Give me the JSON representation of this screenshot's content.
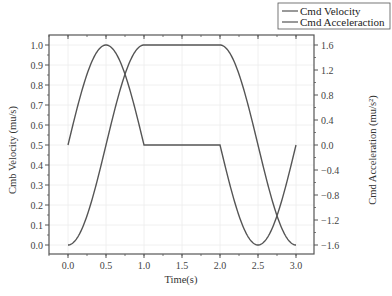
{
  "chart_data": {
    "type": "line",
    "title": "",
    "xlabel": "Time(s)",
    "ylabel": "Cmb Velocity (mu/s)",
    "y2label": "Cmd Acceleration (mu/s²)",
    "xlim": [
      -0.25,
      3.1
    ],
    "ylim": [
      -0.05,
      1.05
    ],
    "y2lim": [
      -1.76,
      1.76
    ],
    "x_ticks": [
      "0.0",
      "0.5",
      "1.0",
      "1.5",
      "2.0",
      "2.5",
      "3.0"
    ],
    "y_ticks": [
      "0.0",
      "0.1",
      "0.2",
      "0.3",
      "0.4",
      "0.5",
      "0.6",
      "0.7",
      "0.8",
      "0.9",
      "1.0"
    ],
    "y2_ticks": [
      "1.6",
      "1.2",
      "0.8",
      "0.4",
      "0.0",
      "-0.4",
      "-0.8",
      "-1.2",
      "-1.6"
    ],
    "grid": true,
    "legend_position": "top-right-outside",
    "series": [
      {
        "name": "Cmd Velocity",
        "axis": "left",
        "x": [
          0.0,
          0.1,
          0.2,
          0.3,
          0.4,
          0.5,
          0.6,
          0.7,
          0.8,
          0.9,
          1.0,
          1.5,
          2.0,
          2.1,
          2.2,
          2.3,
          2.4,
          2.5,
          2.6,
          2.7,
          2.8,
          2.9,
          3.0
        ],
        "values": [
          0.0,
          0.02,
          0.1,
          0.21,
          0.35,
          0.5,
          0.65,
          0.79,
          0.9,
          0.98,
          1.0,
          1.0,
          1.0,
          0.98,
          0.9,
          0.79,
          0.65,
          0.5,
          0.35,
          0.21,
          0.1,
          0.02,
          0.0
        ]
      },
      {
        "name": "Cmd Acceleration",
        "axis": "right",
        "x": [
          0.0,
          0.1,
          0.2,
          0.3,
          0.4,
          0.5,
          0.6,
          0.7,
          0.8,
          0.9,
          1.0,
          1.5,
          2.0,
          2.1,
          2.2,
          2.3,
          2.4,
          2.5,
          2.6,
          2.7,
          2.8,
          2.9,
          3.0
        ],
        "values": [
          0.0,
          0.49,
          0.94,
          1.29,
          1.52,
          1.6,
          1.52,
          1.29,
          0.94,
          0.49,
          0.0,
          0.0,
          0.0,
          -0.49,
          -0.94,
          -1.29,
          -1.52,
          -1.6,
          -1.52,
          -1.29,
          -0.94,
          -0.49,
          0.0
        ]
      }
    ]
  },
  "legend": {
    "items": [
      {
        "label": "Cmd Velocity",
        "color": "#555555"
      },
      {
        "label": "Cmd Acceleraction",
        "color": "#555555"
      }
    ]
  },
  "axes": {
    "x_title": "Time(s)",
    "y_left_title": "Cmb Velocity (mu/s)",
    "y_right_title": "Cmd Acceleration (mu/s²)"
  },
  "colors": {
    "line": "#555555",
    "axis": "#555555",
    "grid": "#ececec"
  }
}
